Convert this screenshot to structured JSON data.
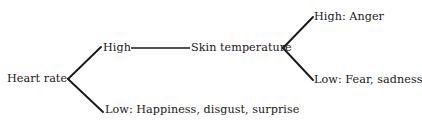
{
  "diagram": {
    "type": "tree",
    "title": "",
    "background_color": "#ffffff",
    "line_color": "#191919",
    "text_color": "#191919",
    "root": {
      "label": "Heart rate",
      "branches": [
        {
          "label": "High",
          "child": {
            "label": "Skin temperature",
            "branches": [
              {
                "label": "High: Anger"
              },
              {
                "label": "Low: Fear, sadness"
              }
            ]
          }
        },
        {
          "label": "Low: Happiness, disgust, surprise"
        }
      ]
    },
    "nodes": {
      "root": "Heart rate",
      "hr_high": "High",
      "hr_low": "Low: Happiness, disgust, surprise",
      "skin_temperature": "Skin temperature",
      "st_high": "High: Anger",
      "st_low": "Low: Fear, sadness"
    }
  }
}
